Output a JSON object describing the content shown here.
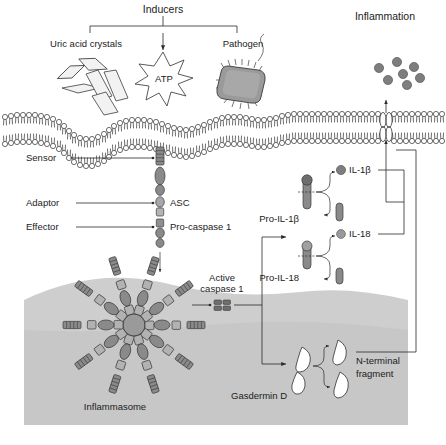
{
  "figure": {
    "title_top": "Inducers",
    "inflammation_label": "Inflammation",
    "background_color": "#ffffff",
    "cytoplasm_color": "#cfcfcf",
    "protein_fill": "#8a8a8a",
    "protein_stroke": "#3a3a3a",
    "line_color": "#2a2a2a"
  },
  "inducers": {
    "bracket_label": "Inducers",
    "items": [
      {
        "name": "uric-acid-crystals",
        "label": "Uric acid crystals"
      },
      {
        "name": "atp",
        "label": "ATP"
      },
      {
        "name": "pathogen",
        "label": "Pathogen"
      }
    ]
  },
  "inflammation": {
    "label": "Inflammation",
    "cytokine_dot_count": 7
  },
  "left_labels": [
    {
      "name": "sensor",
      "label": "Sensor"
    },
    {
      "name": "adaptor",
      "label": "Adaptor"
    },
    {
      "name": "effector",
      "label": "Effector"
    }
  ],
  "complex_labels": [
    {
      "name": "asc",
      "label": "ASC"
    },
    {
      "name": "pro-caspase-1",
      "label": "Pro-caspase 1"
    }
  ],
  "active_caspase": {
    "line1": "Active",
    "line2": "caspase 1"
  },
  "inflammasome": {
    "label": "Inflammasome",
    "spoke_count": 10
  },
  "cytokines": [
    {
      "name": "pro-il-1b",
      "pro_label": "Pro-IL-1β",
      "mature_label": "IL-1β"
    },
    {
      "name": "pro-il-18",
      "pro_label": "Pro-IL-18",
      "mature_label": "IL-18"
    }
  ],
  "gasdermin": {
    "label": "Gasdermin D",
    "fragment_line1": "N-terminal",
    "fragment_line2": "fragment"
  }
}
